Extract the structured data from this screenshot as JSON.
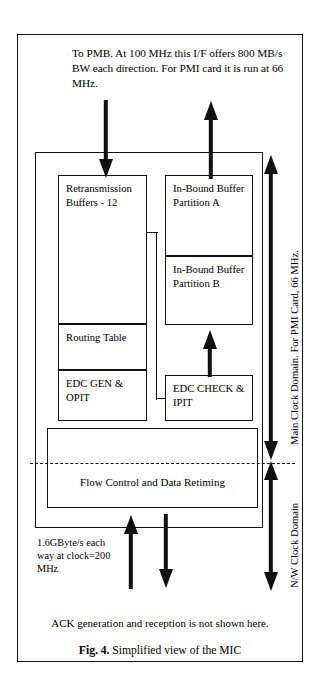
{
  "figure": {
    "top_note": "To PMB. At 100 MHz this I/F offers 800 MB/s BW each direction. For PMI card it is run at 66 MHz.",
    "ack_note": "ACK generation and reception is not shown here.",
    "caption_label": "Fig. 4.",
    "caption_text": "Simplified view of the MIC",
    "bandwidth_note": "1.6GByte/s each way at clock=200 MHz"
  },
  "blocks": {
    "retransmission_buffers": "Retransmission Buffers - 12",
    "routing_table": "Routing Table",
    "edc_gen_opit": "EDC GEN & OPIT",
    "inbound_buffer_a": "In-Bound Buffer Partition A",
    "inbound_buffer_b": "In-Bound Buffer Partition B",
    "edc_check_ipit": "EDC CHECK & IPIT",
    "flow_control": "Flow Control and Data Retiming"
  },
  "clock_domains": {
    "main": "Main Clock Domain. For PMI Card, 66 MHz.",
    "network": "N/W Clock Domain"
  },
  "colors": {
    "ink": "#111111",
    "paper": "#ffffff"
  }
}
